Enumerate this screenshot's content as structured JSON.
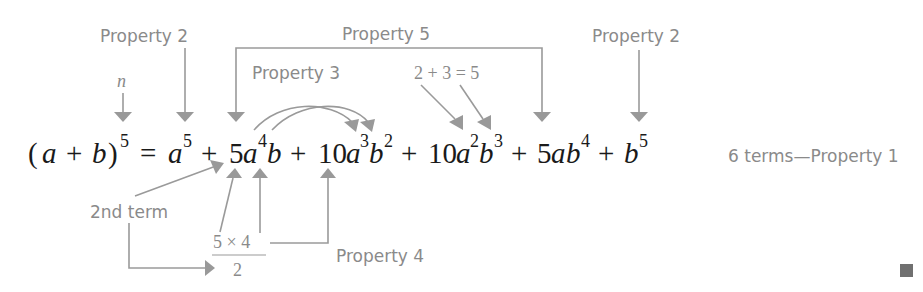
{
  "diagram": {
    "equation": {
      "lhs": {
        "open": "(",
        "a": "a",
        "plus": "+",
        "b": "b",
        "close": ")",
        "exp": "5"
      },
      "equals": "=",
      "terms": [
        {
          "coef": "",
          "a": "a",
          "a_exp": "5",
          "b": "",
          "b_exp": ""
        },
        {
          "coef": "5",
          "a": "a",
          "a_exp": "4",
          "b": "b",
          "b_exp": ""
        },
        {
          "coef": "10",
          "a": "a",
          "a_exp": "3",
          "b": "b",
          "b_exp": "2"
        },
        {
          "coef": "10",
          "a": "a",
          "a_exp": "2",
          "b": "b",
          "b_exp": "3"
        },
        {
          "coef": "5",
          "a": "a",
          "a_exp": "",
          "b": "b",
          "b_exp": "4"
        },
        {
          "coef": "",
          "a": "",
          "a_exp": "",
          "b": "b",
          "b_exp": "5"
        }
      ],
      "plus": "+"
    },
    "annotations": {
      "property2_left": "Property 2",
      "property2_right": "Property 2",
      "property3": "Property 3",
      "property4": "Property 4",
      "property5": "Property 5",
      "n_label": "n",
      "sum_label": "2 + 3 = 5",
      "second_term": "2nd term",
      "fraction_numerator": "5 × 4",
      "fraction_denominator": "2",
      "six_terms": "6 terms—Property 1"
    },
    "colors": {
      "annotation": "#8a8a8a",
      "arrow": "#999999",
      "equation": "#1a1a1a",
      "end_marker": "#707070"
    }
  }
}
